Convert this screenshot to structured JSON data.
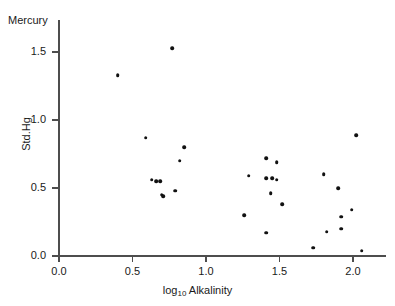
{
  "chart_data": {
    "type": "scatter",
    "title": "Mercury",
    "xlabel": "log10 Alkalinity",
    "xlabel_base": "log",
    "xlabel_sub": "10",
    "xlabel_rest": " Alkalinity",
    "ylabel": "Std.Hg",
    "xlim": [
      -0.05,
      2.22
    ],
    "ylim": [
      -0.03,
      1.74
    ],
    "grid": false,
    "legend": null,
    "xticks": [
      0.0,
      0.5,
      1.0,
      1.5,
      2.0
    ],
    "xticklabels": [
      "0.0",
      "0.5",
      "1.0",
      "1.5",
      "2.0"
    ],
    "yticks": [
      0.0,
      0.5,
      1.0,
      1.5
    ],
    "yticklabels": [
      "0.0",
      "0.5",
      "1.0",
      "1.5"
    ],
    "marker": "filled-circle",
    "marker_color": "#111111",
    "axis_color": "#4d4d4d",
    "background": "#ffffff",
    "n_points": 30,
    "points": [
      {
        "x": 0.4,
        "y": 1.33
      },
      {
        "x": 0.77,
        "y": 1.53
      },
      {
        "x": 0.59,
        "y": 0.87
      },
      {
        "x": 0.85,
        "y": 0.8
      },
      {
        "x": 0.82,
        "y": 0.7
      },
      {
        "x": 0.63,
        "y": 0.56
      },
      {
        "x": 0.69,
        "y": 0.55
      },
      {
        "x": 0.71,
        "y": 0.44
      },
      {
        "x": 0.79,
        "y": 0.48
      },
      {
        "x": 1.41,
        "y": 0.72
      },
      {
        "x": 1.48,
        "y": 0.69
      },
      {
        "x": 1.29,
        "y": 0.59
      },
      {
        "x": 1.41,
        "y": 0.57
      },
      {
        "x": 1.48,
        "y": 0.56
      },
      {
        "x": 1.44,
        "y": 0.46
      },
      {
        "x": 1.52,
        "y": 0.38
      },
      {
        "x": 1.26,
        "y": 0.3
      },
      {
        "x": 1.41,
        "y": 0.17
      },
      {
        "x": 1.73,
        "y": 0.06
      },
      {
        "x": 1.8,
        "y": 0.6
      },
      {
        "x": 2.02,
        "y": 0.89
      },
      {
        "x": 1.9,
        "y": 0.5
      },
      {
        "x": 1.92,
        "y": 0.29
      },
      {
        "x": 1.99,
        "y": 0.34
      },
      {
        "x": 1.82,
        "y": 0.18
      },
      {
        "x": 1.92,
        "y": 0.2
      },
      {
        "x": 2.06,
        "y": 0.04
      },
      {
        "x": 0.66,
        "y": 0.55
      },
      {
        "x": 0.7,
        "y": 0.45
      },
      {
        "x": 1.45,
        "y": 0.57
      }
    ]
  }
}
